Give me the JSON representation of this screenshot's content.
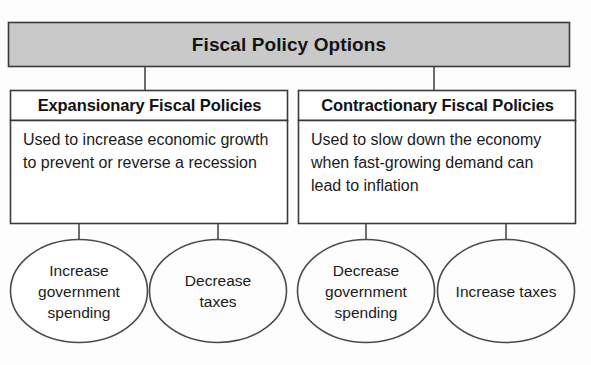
{
  "diagram": {
    "title": "Fiscal Policy Options",
    "title_box": {
      "fill": "#c9c9c9",
      "stroke": "#3a3a3a"
    },
    "branches": [
      {
        "id": "expansionary",
        "heading": "Expansionary Fiscal Policies",
        "description": "Used to increase economic growth to prevent or reverse a recession",
        "options": [
          {
            "id": "increase-government-spending",
            "label": "Increase government spending"
          },
          {
            "id": "decrease-taxes",
            "label": "Decrease taxes"
          }
        ]
      },
      {
        "id": "contractionary",
        "heading": "Contractionary Fiscal Policies",
        "description": "Used to slow down the economy when fast-growing demand can lead to inflation",
        "options": [
          {
            "id": "decrease-government-spending",
            "label": "Decrease government spending"
          },
          {
            "id": "increase-taxes",
            "label": "Increase taxes"
          }
        ]
      }
    ],
    "colors": {
      "outline": "#3a3a3a",
      "ellipse_outline": "#4a4a4a",
      "connector": "#4a4a4a",
      "box_fill": "#ffffff",
      "page_background": "#fdfdfd",
      "text": "#1a1a1a"
    }
  }
}
